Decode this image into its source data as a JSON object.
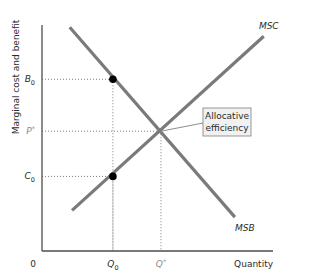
{
  "chart_data": {
    "type": "line",
    "title": "",
    "xlabel": "Quantity",
    "ylabel": "Marginal cost and benefit",
    "xlim": [
      0,
      10
    ],
    "ylim": [
      0,
      10
    ],
    "grid": false,
    "origin_label": "0",
    "series": [
      {
        "name": "MSB",
        "label": "MSB",
        "points": [
          [
            1.2,
            9.9
          ],
          [
            8.35,
            1.5
          ]
        ]
      },
      {
        "name": "MSC",
        "label": "MSC",
        "points": [
          [
            1.3,
            1.8
          ],
          [
            9.6,
            9.5
          ]
        ]
      }
    ],
    "x_ticks": [
      {
        "value": 3.07,
        "label": "Q",
        "sub": "0",
        "sup": "",
        "highlight": false
      },
      {
        "value": 5.15,
        "label": "Q",
        "sub": "",
        "sup": "*",
        "highlight": true
      }
    ],
    "y_ticks": [
      {
        "value": 7.6,
        "label": "B",
        "sub": "0",
        "sup": "",
        "highlight": false
      },
      {
        "value": 5.3,
        "label": "P",
        "sub": "",
        "sup": "*",
        "highlight": true
      },
      {
        "value": 3.3,
        "label": "C",
        "sub": "0",
        "sup": "",
        "highlight": false
      }
    ],
    "guides": [
      {
        "x": 3.07,
        "y": 7.6
      },
      {
        "x": 5.15,
        "y": 5.3
      },
      {
        "x": 3.07,
        "y": 3.3
      }
    ],
    "points": [
      {
        "name": "benefit-at-Q0",
        "x": 3.07,
        "y": 7.6
      },
      {
        "name": "cost-at-Q0",
        "x": 3.07,
        "y": 3.3
      }
    ],
    "annotation": {
      "lines": [
        "Allocative",
        "efficiency"
      ],
      "target": {
        "x": 5.15,
        "y": 5.3
      },
      "placement": "right-of-target"
    }
  }
}
